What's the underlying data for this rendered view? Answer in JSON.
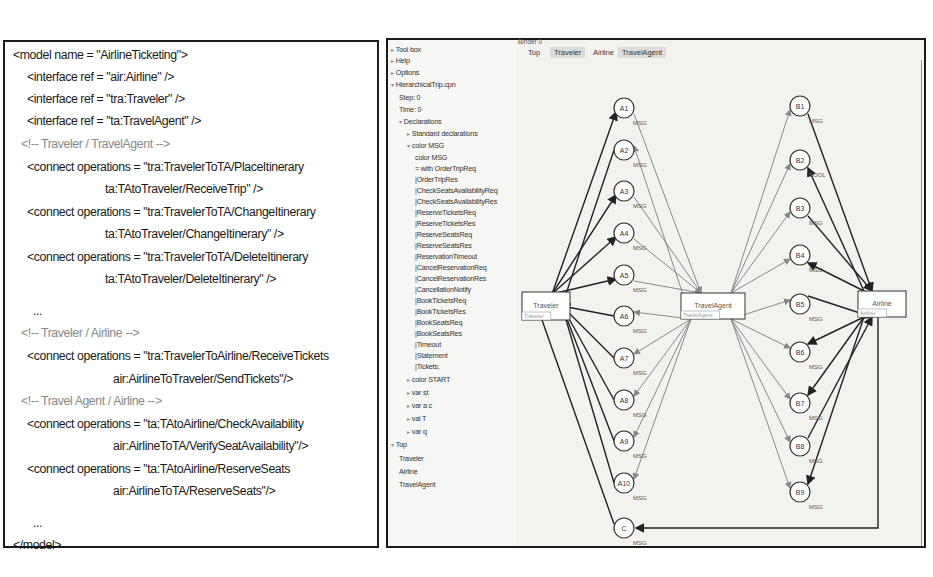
{
  "xml_model": {
    "lines": [
      {
        "text": "<model name = \"AirlineTicketing\">",
        "type": "code"
      },
      {
        "text": "<interface ref = \"air:Airline\" />",
        "type": "code"
      },
      {
        "text": "<interface ref = \"tra:Traveler\" />",
        "type": "code"
      },
      {
        "text": "<interface ref = \"ta:TravelAgent\" />",
        "type": "code"
      },
      {
        "text": "<!-- Traveler / TravelAgent -->",
        "type": "comment"
      },
      {
        "text": "<connect operations = \"tra:TravelerToTA/PlaceItinerary",
        "type": "code"
      },
      {
        "text": "ta:TAtoTraveler/ReceiveTrip\" />",
        "type": "code"
      },
      {
        "text": "<connect operations = \"tra:TravelerToTA/ChangeItinerary",
        "type": "code"
      },
      {
        "text": "ta:TAtoTraveler/ChangeItinerary\" />",
        "type": "code"
      },
      {
        "text": "<connect operations = \"tra:TravelerToTA/DeleteItinerary",
        "type": "code"
      },
      {
        "text": "ta:TAtoTraveler/DeleteItinerary\" />",
        "type": "code"
      },
      {
        "text": "...",
        "type": "ellipsis"
      },
      {
        "text": "<!-- Traveler / Airline -->",
        "type": "comment"
      },
      {
        "text": "<connect operations = \"tra:TravelerToAirline/ReceiveTickets",
        "type": "code"
      },
      {
        "text": "air:AirlineToTraveler/SendTickets\"/>",
        "type": "code"
      },
      {
        "text": "<!-- Travel Agent / Airline -->",
        "type": "comment"
      },
      {
        "text": "<connect operations = \"ta:TAtoAirline/CheckAvailability",
        "type": "code"
      },
      {
        "text": "air:AirlineToTA/VerifySeatAvailability\"/>",
        "type": "code"
      },
      {
        "text": "<connect operations = \"ta:TAtoAirline/ReserveSeats",
        "type": "code"
      },
      {
        "text": "air:AirlineToTA/ReserveSeats\"/>",
        "type": "code"
      },
      {
        "text": "...",
        "type": "ellipsis"
      },
      {
        "text": "</model>",
        "type": "code"
      }
    ]
  },
  "cpn_tools": {
    "index": [
      {
        "label": "Tool box",
        "expander": "▸",
        "indent": 0
      },
      {
        "label": "Help",
        "expander": "▸",
        "indent": 0
      },
      {
        "label": "Options",
        "expander": "▸",
        "indent": 0
      },
      {
        "label": "HierarchicalTrip.cpn",
        "expander": "▾",
        "indent": 0
      },
      {
        "label": "Step: 0",
        "expander": "",
        "indent": 1
      },
      {
        "label": "Time: 0",
        "expander": "",
        "indent": 1
      },
      {
        "label": "Declarations",
        "expander": "▾",
        "indent": 1
      },
      {
        "label": "Standard declarations",
        "expander": "▸",
        "indent": 2
      },
      {
        "label": "color MSG",
        "expander": "▾",
        "indent": 2
      },
      {
        "label": "color MSG",
        "expander": "",
        "indent": 3
      },
      {
        "label": "= with OrderTripReq",
        "expander": "",
        "indent": 3
      },
      {
        "label": "|OrderTripRes",
        "expander": "",
        "indent": 3
      },
      {
        "label": "|CheckSeatsAvailabilityReq",
        "expander": "",
        "indent": 3
      },
      {
        "label": "|CheckSeatsAvailabilityRes",
        "expander": "",
        "indent": 3
      },
      {
        "label": "|ReserveTicketsReq",
        "expander": "",
        "indent": 3
      },
      {
        "label": "|ReserveTicketsRes",
        "expander": "",
        "indent": 3
      },
      {
        "label": "|ReserveSeatsReq",
        "expander": "",
        "indent": 3
      },
      {
        "label": "|ReserveSeatsRes",
        "expander": "",
        "indent": 3
      },
      {
        "label": "|ReservationTimeout",
        "expander": "",
        "indent": 3
      },
      {
        "label": "|CancelReservationReq",
        "expander": "",
        "indent": 3
      },
      {
        "label": "|CancelReservationRes",
        "expander": "",
        "indent": 3
      },
      {
        "label": "|CancellationNotify",
        "expander": "",
        "indent": 3
      },
      {
        "label": "|BookTicketsReq",
        "expander": "",
        "indent": 3
      },
      {
        "label": "|BookTicketsRes",
        "expander": "",
        "indent": 3
      },
      {
        "label": "|BookSeatsReq",
        "expander": "",
        "indent": 3
      },
      {
        "label": "|BookSeatsRes",
        "expander": "",
        "indent": 3
      },
      {
        "label": "|Timeout",
        "expander": "",
        "indent": 3
      },
      {
        "label": "|Statement",
        "expander": "",
        "indent": 3
      },
      {
        "label": "|Tickets;",
        "expander": "",
        "indent": 3
      },
      {
        "label": "color START",
        "expander": "▸",
        "indent": 2
      },
      {
        "label": "var st",
        "expander": "▸",
        "indent": 2
      },
      {
        "label": "var a c",
        "expander": "▸",
        "indent": 2
      },
      {
        "label": "val T",
        "expander": "▸",
        "indent": 2
      },
      {
        "label": "var q",
        "expander": "▸",
        "indent": 2
      },
      {
        "label": "Top",
        "expander": "▾",
        "indent": 0
      },
      {
        "label": "Traveler",
        "expander": "",
        "indent": 1
      },
      {
        "label": "Airline",
        "expander": "",
        "indent": 1
      },
      {
        "label": "TravelAgent",
        "expander": "",
        "indent": 1
      }
    ],
    "binder": {
      "label": "Binder 0",
      "tabs": [
        {
          "label": "Top",
          "active": true
        },
        {
          "label": "Traveler",
          "active": false
        },
        {
          "label": "Airline",
          "active": false
        },
        {
          "label": "TravelAgent",
          "active": false
        }
      ]
    },
    "net": {
      "transitions": [
        {
          "id": "traveler",
          "label": "Traveler",
          "tag": "Traveler"
        },
        {
          "id": "travelagent",
          "label": "TravelAgent",
          "tag": "TravelAgent"
        },
        {
          "id": "airline",
          "label": "Airline",
          "tag": "Airline"
        }
      ],
      "places_a": [
        "A1",
        "A2",
        "A3",
        "A4",
        "A5",
        "A6",
        "A7",
        "A8",
        "A9",
        "A10"
      ],
      "places_b": [
        "B1",
        "B2",
        "B3",
        "B4",
        "B5",
        "B6",
        "B7",
        "B8",
        "B9"
      ],
      "place_c": "C",
      "colorset_label": "MSG",
      "alt_colorset_label": "BOOL"
    }
  }
}
